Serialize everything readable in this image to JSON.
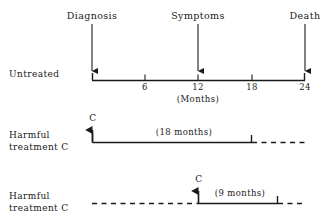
{
  "figure": {
    "type": "timeline-diagram",
    "background_color": "#ffffff",
    "ink_color": "#1a1a1a"
  },
  "events": [
    {
      "label": "Diagnosis",
      "month": 0
    },
    {
      "label": "Symptoms",
      "month": 12
    },
    {
      "label": "Death",
      "month": 24
    }
  ],
  "axis": {
    "unit_label": "(Months)",
    "ticks": [
      "6",
      "12",
      "18",
      "24"
    ],
    "tick_months": [
      6,
      12,
      18,
      24
    ],
    "range_months": [
      0,
      24
    ]
  },
  "rows": [
    {
      "id": "untreated",
      "label_line1": "Untreated",
      "label_line2": "",
      "span_label": "",
      "marker_label": ""
    },
    {
      "id": "harmful-treatment-c-early",
      "label_line1": "Harmful",
      "label_line2": "treatment C",
      "span_label": "(18 months)",
      "marker_label": "C"
    },
    {
      "id": "harmful-treatment-c-late",
      "label_line1": "Harmful",
      "label_line2": "treatment C",
      "span_label": "(9 months)",
      "marker_label": "C"
    }
  ]
}
